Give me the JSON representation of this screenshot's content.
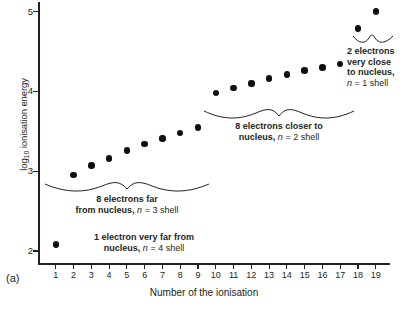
{
  "figure": {
    "panel_label": "(a)",
    "caption_sliver": "(Figure is cropped at the bottom of the page)"
  },
  "chart_data": {
    "type": "scatter",
    "title": "",
    "xlabel": "Number of the ionisation",
    "ylabel": "log10 ionisation energy",
    "ylabel_base": "log",
    "ylabel_sub": "10",
    "ylabel_rest": " ionisation energy",
    "x": [
      1,
      2,
      3,
      4,
      5,
      6,
      7,
      8,
      9,
      10,
      11,
      12,
      13,
      14,
      15,
      16,
      17,
      18,
      19
    ],
    "values": [
      2.08,
      2.95,
      3.07,
      3.16,
      3.26,
      3.34,
      3.41,
      3.48,
      3.55,
      3.98,
      4.04,
      4.1,
      4.16,
      4.21,
      4.26,
      4.3,
      4.34,
      4.79,
      5.0
    ],
    "xlim": [
      0,
      19.8
    ],
    "ylim": [
      1.85,
      5.12
    ],
    "xticks": [
      1,
      2,
      3,
      4,
      5,
      6,
      7,
      8,
      9,
      10,
      11,
      12,
      13,
      14,
      15,
      16,
      17,
      18,
      19
    ],
    "xtick_labels": [
      "1",
      "2",
      "3",
      "4",
      "5",
      "6",
      "7",
      "8",
      "9",
      "10",
      "11",
      "12",
      "13",
      "14",
      "15",
      "16",
      "17",
      "18",
      "19"
    ],
    "yticks": [
      2,
      3,
      4,
      5
    ],
    "ytick_labels": [
      "2",
      "3",
      "4",
      "5"
    ],
    "grid": false,
    "legend": null,
    "marker": "filled-circle",
    "marker_color": "#0f0f0f",
    "axis_color": "#231f20",
    "annotations": [
      {
        "id": "shell-n4",
        "line1": "1 electron very far from",
        "line2_bold": "nucleus,",
        "line2_italic": "n",
        "line2_rest": " = 4 shell",
        "covers_points": [
          1
        ],
        "brace": false
      },
      {
        "id": "shell-n3",
        "line1": "8 electrons far",
        "line2_bold": "from nucleus,",
        "line2_italic": "n",
        "line2_rest": " = 3 shell",
        "covers_points": [
          2,
          3,
          4,
          5,
          6,
          7,
          8,
          9
        ],
        "brace": true
      },
      {
        "id": "shell-n2",
        "line1": "8 electrons closer to",
        "line2_bold": "nucleus,",
        "line2_italic": "n",
        "line2_rest": " = 2 shell",
        "covers_points": [
          10,
          11,
          12,
          13,
          14,
          15,
          16,
          17
        ],
        "brace": true
      },
      {
        "id": "shell-n1",
        "line1": "2 electrons",
        "line2": "very close",
        "line3_bold": "to nucleus,",
        "line4_italic": "n",
        "line4_rest": " = 1 shell",
        "covers_points": [
          18,
          19
        ],
        "brace": true
      }
    ]
  }
}
